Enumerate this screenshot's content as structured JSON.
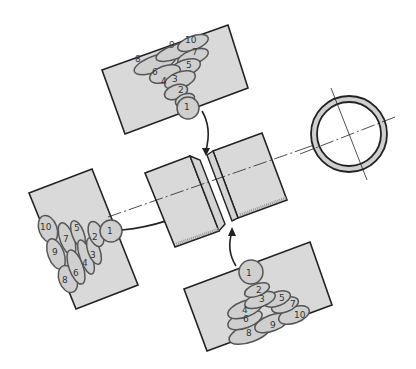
{
  "figure": {
    "top_view": {
      "label": "top-weld-sequence",
      "beads": [
        "1",
        "2",
        "3",
        "4",
        "5",
        "6",
        "7",
        "8",
        "9",
        "10"
      ]
    },
    "left_view": {
      "label": "left-weld-sequence",
      "beads": [
        "1",
        "2",
        "3",
        "4",
        "5",
        "6",
        "7",
        "8",
        "9",
        "10"
      ]
    },
    "bottom_view": {
      "label": "bottom-weld-sequence",
      "beads": [
        "1",
        "2",
        "3",
        "4",
        "5",
        "6",
        "7",
        "8",
        "9",
        "10"
      ]
    },
    "center_view": {
      "label": "pipe-joint-with-groove"
    },
    "cross_section": {
      "label": "pipe-cross-section"
    },
    "colors": {
      "plate_fill": "#d9d9d9",
      "bead_fill": "#cfcfcf",
      "bead_stroke": "#555555",
      "line": "#222222"
    }
  }
}
